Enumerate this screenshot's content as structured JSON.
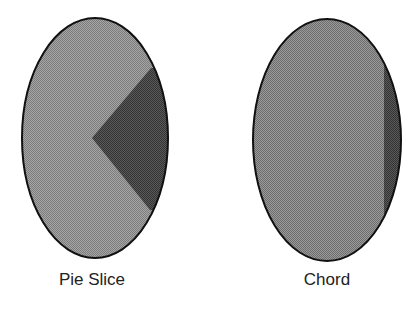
{
  "figures": [
    {
      "id": "pie-slice",
      "label": "Pie Slice",
      "shape": "ellipse-with-wedge",
      "ellipse": {
        "cx": 95,
        "cy": 138,
        "rx": 73,
        "ry": 120
      },
      "wedge": {
        "apex": [
          92,
          138
        ],
        "start": [
          151,
          70
        ],
        "end": [
          150,
          208
        ]
      }
    },
    {
      "id": "chord",
      "label": "Chord",
      "shape": "ellipse-with-chord",
      "ellipse": {
        "cx": 327,
        "cy": 140,
        "rx": 74,
        "ry": 121
      },
      "chord_x": 384
    }
  ],
  "colors": {
    "background": "#ffffff",
    "fill_light": "#9a9a9a",
    "fill_medium": "#8a8a8a",
    "fill_dark": "#4a4a4a",
    "outline": "#111111",
    "text": "#222222"
  }
}
